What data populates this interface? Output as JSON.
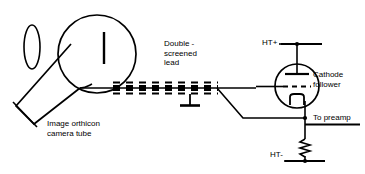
{
  "diagram": {
    "stroke_color": "#000000",
    "background_color": "#ffffff",
    "labels": {
      "double_screened_lead": "Double -\nscreened\nlead",
      "image_orthicon_camera_tube": "Image orthicon\ncamera tube",
      "cathode_follower": "Cathode\nfollower",
      "ht_plus": "HT+",
      "ht_minus": "HT-",
      "to_preamp": "To preamp"
    },
    "components": [
      {
        "name": "lens-ellipse",
        "type": "ellipse"
      },
      {
        "name": "camera-tube-bulb",
        "type": "circle"
      },
      {
        "name": "camera-tube-target",
        "type": "line"
      },
      {
        "name": "camera-tube-neck",
        "type": "polygon"
      },
      {
        "name": "double-screened-lead",
        "type": "coaxial-cable"
      },
      {
        "name": "lead-ground-symbol",
        "type": "ground"
      },
      {
        "name": "vacuum-tube-triode",
        "type": "triode"
      },
      {
        "name": "triode-plate",
        "type": "electrode"
      },
      {
        "name": "triode-grid",
        "type": "electrode"
      },
      {
        "name": "triode-cathode",
        "type": "electrode"
      },
      {
        "name": "cathode-resistor",
        "type": "resistor"
      },
      {
        "name": "ht-plus-rail",
        "type": "rail"
      },
      {
        "name": "ht-minus-rail",
        "type": "rail"
      },
      {
        "name": "output-preamp-rail",
        "type": "rail"
      },
      {
        "name": "junction-dot-ht-plus",
        "type": "junction"
      },
      {
        "name": "junction-dot-output",
        "type": "junction"
      },
      {
        "name": "junction-dot-ht-minus",
        "type": "junction"
      }
    ]
  }
}
